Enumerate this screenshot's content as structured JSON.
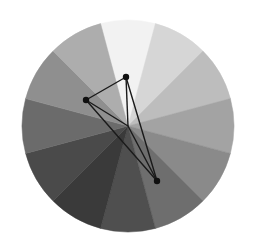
{
  "figure": {
    "title": "",
    "background_color": "#ffffff",
    "width": 255,
    "height": 252
  },
  "chart_data": {
    "type": "pie",
    "title": "",
    "subtitle": "",
    "xlabel": "",
    "ylabel": "",
    "grid": false,
    "legend_position": "none",
    "center": {
      "x": 128,
      "y": 126
    },
    "radius": 106,
    "n_sectors": 12,
    "sector_span_degrees": 30,
    "start_angle_degrees": -105,
    "categories": [
      "sector-1",
      "sector-2",
      "sector-3",
      "sector-4",
      "sector-5",
      "sector-6",
      "sector-7",
      "sector-8",
      "sector-9",
      "sector-10",
      "sector-11",
      "sector-12"
    ],
    "values": [
      30,
      30,
      30,
      30,
      30,
      30,
      30,
      30,
      30,
      30,
      30,
      30
    ],
    "colors": [
      "#f2f2f2",
      "#d6d6d6",
      "#bdbdbd",
      "#a3a3a3",
      "#8a8a8a",
      "#6e6e6e",
      "#4f4f4f",
      "#3a3a3a",
      "#4a4a4a",
      "#6b6b6b",
      "#8f8f8f",
      "#adadad"
    ],
    "sector_labels": [
      "",
      "",
      "",
      "",
      "",
      "",
      "",
      "",
      "",
      "",
      "",
      ""
    ]
  },
  "overlay": {
    "stroke_color": "#1a1a1a",
    "stroke_width": 1.4,
    "marker_color": "#101010",
    "marker_radius": 3.2,
    "polygon_points": [
      {
        "name": "vertex-top",
        "x": 126,
        "y": 77
      },
      {
        "name": "vertex-left",
        "x": 86,
        "y": 100
      },
      {
        "name": "vertex-bottom",
        "x": 157,
        "y": 181
      }
    ],
    "center_spokes": [
      {
        "name": "spoke-to-top",
        "x1": 128,
        "y1": 126,
        "x2": 126,
        "y2": 77
      },
      {
        "name": "spoke-to-left",
        "x1": 128,
        "y1": 126,
        "x2": 86,
        "y2": 100
      },
      {
        "name": "spoke-to-bottom",
        "x1": 128,
        "y1": 126,
        "x2": 157,
        "y2": 181
      }
    ]
  }
}
